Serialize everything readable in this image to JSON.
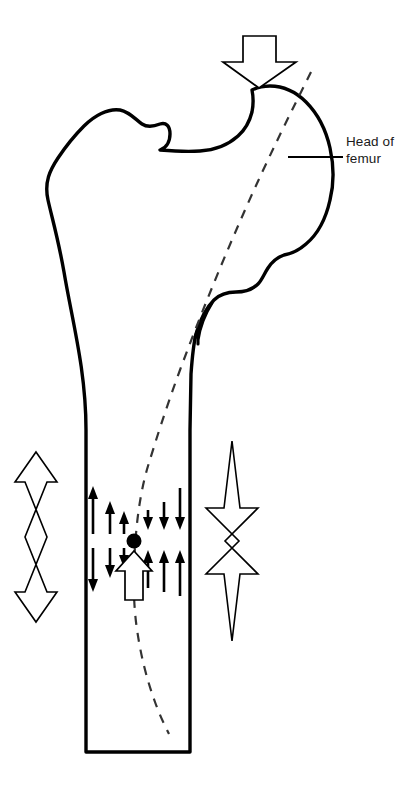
{
  "figure": {
    "background_color": "#ffffff",
    "stroke_color": "#000000",
    "annotations": [
      {
        "id": "head-of-femur",
        "text": "Head of\nfemur",
        "leader_line": "horizontal"
      }
    ]
  },
  "labels": {
    "head_of_femur": "Head of\nfemur"
  },
  "icons": {
    "load_arrow": "down-arrow-hollow-icon",
    "tension_arrow": "double-arrow-outward-hollow-icon",
    "compression_arrow": "double-arrow-inward-hollow-icon",
    "neutral_axis_point": "filled-circle-icon",
    "resultant_arrow": "up-arrow-hollow-icon"
  },
  "elements": {
    "applied_load_arrow": {
      "name": "applied-load-arrow",
      "direction": "down",
      "style": "hollow",
      "x": 259,
      "y": 33
    },
    "tension_arrow": {
      "name": "tension-double-arrow",
      "direction": "outward",
      "style": "hollow",
      "x": 36,
      "y": 450
    },
    "compression_arrow": {
      "name": "compression-double-arrow",
      "direction": "inward",
      "style": "hollow",
      "x": 232,
      "y": 440
    },
    "neutral_axis": {
      "name": "neutral-axis-dashed-line",
      "style": "dashed"
    },
    "neutral_axis_point": {
      "name": "neutral-axis-point",
      "style": "filled-circle",
      "x": 134,
      "y": 541,
      "radius": 7
    },
    "resultant_arrow": {
      "name": "resultant-force-arrow",
      "direction": "up",
      "style": "hollow",
      "x": 134,
      "y": 575
    }
  },
  "stress_arrows": {
    "description": "Bending stress distribution arrows across the femoral shaft",
    "left_group": {
      "upper_direction": "up",
      "lower_direction": "down",
      "count": 3
    },
    "right_group": {
      "upper_direction": "down",
      "lower_direction": "up",
      "count": 3
    }
  },
  "colors": {
    "stroke": "#000000",
    "fill": "#ffffff",
    "text": "#1a1a1a"
  }
}
